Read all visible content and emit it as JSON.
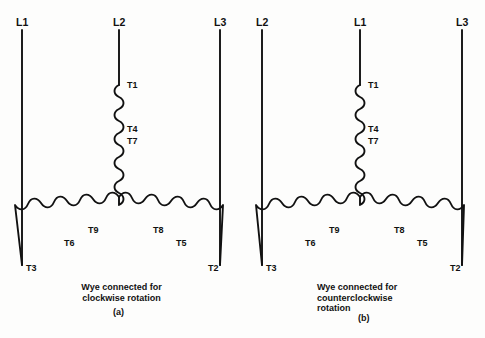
{
  "figure": {
    "background_color": "#fdfdfc",
    "ink_color": "#111111",
    "type": "wye-connected-motor-winding-diagram"
  },
  "panels": [
    {
      "id": "a",
      "caption": "Wye connected for\nclockwise rotation",
      "caption_id": "(a)",
      "supply_lines": [
        {
          "label": "L1",
          "position": "left"
        },
        {
          "label": "L2",
          "position": "center"
        },
        {
          "label": "L3",
          "position": "right"
        }
      ],
      "terminals": {
        "center_top": "T1",
        "center_mid_upper": "T4",
        "center_mid_lower": "T7",
        "left_inner": "T9",
        "left_outer": "T6",
        "left_end": "T3",
        "right_inner": "T8",
        "right_outer": "T5",
        "right_end": "T2"
      }
    },
    {
      "id": "b",
      "caption": "Wye connected for\ncounterclockwise\nrotation",
      "caption_id": "(b)",
      "supply_lines": [
        {
          "label": "L2",
          "position": "left"
        },
        {
          "label": "L1",
          "position": "center"
        },
        {
          "label": "L3",
          "position": "right"
        }
      ],
      "terminals": {
        "center_top": "T1",
        "center_mid_upper": "T4",
        "center_mid_lower": "T7",
        "left_inner": "T9",
        "left_outer": "T6",
        "left_end": "T3",
        "right_inner": "T8",
        "right_outer": "T5",
        "right_end": "T2"
      }
    }
  ]
}
